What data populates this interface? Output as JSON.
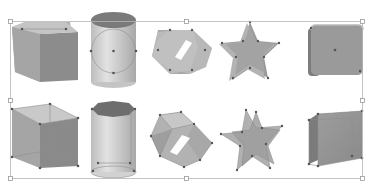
{
  "figure": {
    "colors": {
      "background": "#ffffff",
      "face_light": "#c9c9c9",
      "face_mid": "#a9a9a9",
      "face_dark": "#8a8a8a",
      "face_darker": "#7a7a7a",
      "cap_dark": "#6f6f6f",
      "edge": "#8f8f8f",
      "node": "#555555",
      "selection_line": "#b5b5b5",
      "handle_fill": "#ffffff",
      "handle_stroke": "#9a9a9a"
    },
    "selection_box": {
      "x": 10,
      "y": 21,
      "width": 353,
      "height": 157
    },
    "rows": [
      {
        "name": "solid-row",
        "shapes": [
          "cube",
          "cylinder",
          "hexagonal-prism",
          "star-prism",
          "rounded-box"
        ]
      },
      {
        "name": "wireframe-row",
        "shapes": [
          "cube",
          "cylinder",
          "hexagonal-prism",
          "star-prism",
          "box"
        ]
      }
    ]
  }
}
